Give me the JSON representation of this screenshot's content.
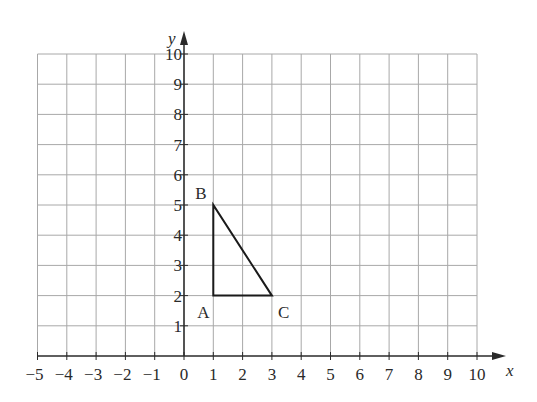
{
  "diagram": {
    "type": "coordinate-grid",
    "x_axis": {
      "label": "x",
      "min": -5,
      "max": 10,
      "ticks": [
        "−5",
        "−4",
        "−3",
        "−2",
        "−1",
        "0",
        "1",
        "2",
        "3",
        "4",
        "5",
        "6",
        "7",
        "8",
        "9",
        "10"
      ]
    },
    "y_axis": {
      "label": "y",
      "min": 0,
      "max": 10,
      "ticks": [
        "1",
        "2",
        "3",
        "4",
        "5",
        "6",
        "7",
        "8",
        "9",
        "10"
      ]
    },
    "triangle": {
      "name": "ABC",
      "vertices": [
        {
          "label": "A",
          "x": 1,
          "y": 2
        },
        {
          "label": "B",
          "x": 1,
          "y": 5
        },
        {
          "label": "C",
          "x": 3,
          "y": 2
        }
      ]
    },
    "colors": {
      "grid": "#a8a8a8",
      "axis": "#2a2a2a",
      "shape": "#1a1a1a"
    }
  }
}
